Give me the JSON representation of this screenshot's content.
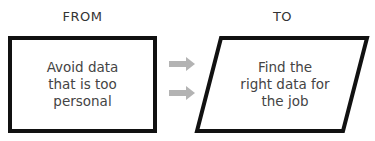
{
  "from": {
    "heading": "FROM",
    "text": "Avoid data\nthat is too\npersonal"
  },
  "to": {
    "heading": "TO",
    "text": "Find the\nright data for\nthe job"
  },
  "arrows": {
    "count": 2,
    "color": "#b3b3b3"
  },
  "colors": {
    "border": "#111111",
    "text": "#444444"
  }
}
